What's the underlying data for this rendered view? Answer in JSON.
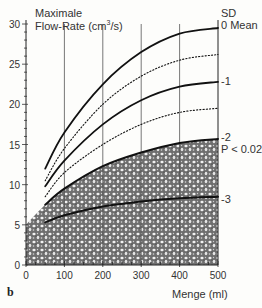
{
  "chart_data": {
    "type": "line",
    "panel_label": "b",
    "ylabel_line1": "Maximale",
    "ylabel_line2": "Flow-Rate (cm",
    "ylabel_sup": "3",
    "ylabel_end": "/s)",
    "xlabel": "Menge (ml)",
    "xlim": [
      0,
      500
    ],
    "ylim": [
      0,
      30
    ],
    "xticks": [
      0,
      100,
      200,
      300,
      400,
      500
    ],
    "yticks": [
      0,
      5,
      10,
      15,
      20,
      25,
      30
    ],
    "grid": "vertical lines at x = 100, 200, 300, 400",
    "legend_header": "SD",
    "x": [
      50,
      100,
      200,
      300,
      400,
      500
    ],
    "series": [
      {
        "name": "0 Mean",
        "style": "solid",
        "values": [
          12,
          16.5,
          22.5,
          26.5,
          28.8,
          29.5
        ]
      },
      {
        "name": "-0.5",
        "style": "dotted",
        "values": [
          10.5,
          14.5,
          20,
          23.5,
          25.5,
          26.2
        ]
      },
      {
        "name": "-1",
        "style": "solid",
        "values": [
          9.8,
          13,
          17.5,
          20.5,
          22.2,
          22.8
        ]
      },
      {
        "name": "-1.5",
        "style": "dotted",
        "values": [
          8.5,
          11.5,
          15,
          17.5,
          19,
          19.5
        ]
      },
      {
        "name": "-2",
        "style": "solid",
        "values": [
          7.5,
          9.5,
          12.3,
          14,
          15.2,
          15.7
        ]
      },
      {
        "name": "-3",
        "style": "solid",
        "values": [
          5.3,
          6.2,
          7.3,
          7.9,
          8.3,
          8.5
        ]
      }
    ],
    "shaded_region": {
      "description": "Stippled area below -2 SD curve",
      "label": "P < 0.025"
    },
    "right_labels": {
      "sd": "SD",
      "mean": "0 Mean",
      "m1": "-1",
      "m2": "-2",
      "p": "P < 0.025",
      "m3": "-3"
    }
  }
}
